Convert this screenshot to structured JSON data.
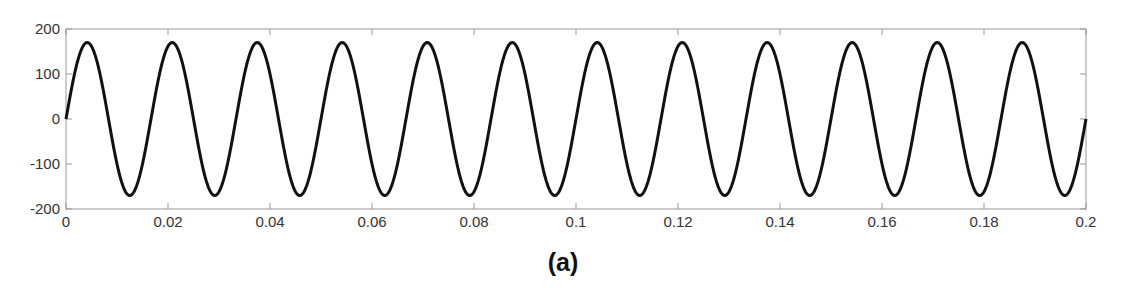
{
  "caption": "(a)",
  "colors": {
    "line": "#111111",
    "axes": "#999999",
    "text": "#333333",
    "background": "#ffffff"
  },
  "plot_box": {
    "left": 66,
    "top": 29,
    "right": 1086,
    "bottom": 209
  },
  "chart_data": {
    "type": "line",
    "title": "",
    "xlabel": "",
    "ylabel": "",
    "xlim": [
      0,
      0.2
    ],
    "ylim": [
      -200,
      200
    ],
    "xticks": [
      0,
      0.02,
      0.04,
      0.06,
      0.08,
      0.1,
      0.12,
      0.14,
      0.16,
      0.18,
      0.2
    ],
    "xtick_labels": [
      "0",
      "0.02",
      "0.04",
      "0.06",
      "0.08",
      "0.1",
      "0.12",
      "0.14",
      "0.16",
      "0.18",
      "0.2"
    ],
    "yticks": [
      -200,
      -100,
      0,
      100,
      200
    ],
    "ytick_labels": [
      "-200",
      "-100",
      "0",
      "100",
      "200"
    ],
    "grid": false,
    "legend": null,
    "series": [
      {
        "name": "waveform",
        "function": "sine",
        "amplitude": 170,
        "frequency_hz": 60,
        "phase": 0,
        "cycles_shown": 12,
        "peak_value": 170,
        "trough_value": -170
      }
    ]
  }
}
